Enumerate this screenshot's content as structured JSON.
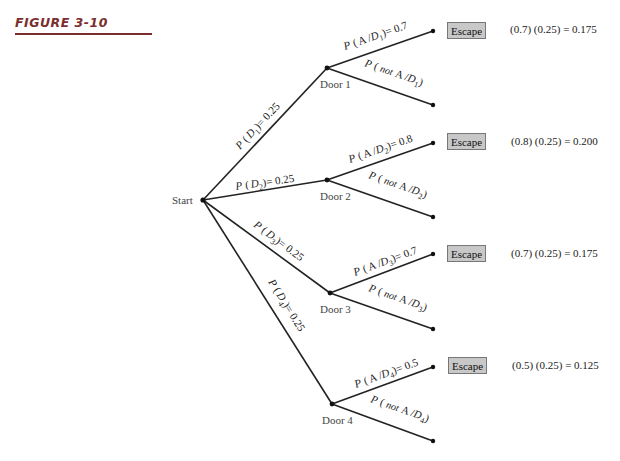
{
  "figure": {
    "title": "FIGURE 3-10",
    "accent_color": "#7a2e2e"
  },
  "tree": {
    "root": {
      "label": "Start"
    },
    "doors": [
      {
        "label": "Door 1",
        "edge_label": {
          "p": "P",
          "open": "(",
          "var": "D",
          "sub": "1",
          "close": ")= 0.25"
        },
        "escape_edge": {
          "p": "P",
          "open": "(",
          "a": "A /",
          "var": "D",
          "sub": "1",
          "close": ")= 0.7"
        },
        "fail_edge": {
          "p": "P",
          "open": "(",
          "not": "not",
          "a": "A /",
          "var": "D",
          "sub": "1",
          "close": ")"
        },
        "escape_label": "Escape",
        "formula": "(0.7) (0.25) = 0.175"
      },
      {
        "label": "Door 2",
        "edge_label": {
          "p": "P",
          "open": "(",
          "var": "D",
          "sub": "2",
          "close": ")= 0.25"
        },
        "escape_edge": {
          "p": "P",
          "open": "(",
          "a": "A /",
          "var": "D",
          "sub": "2",
          "close": ")= 0.8"
        },
        "fail_edge": {
          "p": "P",
          "open": "(",
          "not": "not",
          "a": "A /",
          "var": "D",
          "sub": "2",
          "close": ")"
        },
        "escape_label": "Escape",
        "formula": "(0.8) (0.25) = 0.200"
      },
      {
        "label": "Door 3",
        "edge_label": {
          "p": "P",
          "open": "(",
          "var": "D",
          "sub": "3",
          "close": ")= 0.25"
        },
        "escape_edge": {
          "p": "P",
          "open": "(",
          "a": "A /",
          "var": "D",
          "sub": "3",
          "close": ")= 0.7"
        },
        "fail_edge": {
          "p": "P",
          "open": "(",
          "not": "not",
          "a": "A /",
          "var": "D",
          "sub": "3",
          "close": ")"
        },
        "escape_label": "Escape",
        "formula": "(0.7) (0.25) = 0.175"
      },
      {
        "label": "Door 4",
        "edge_label": {
          "p": "P",
          "open": "(",
          "var": "D",
          "sub": "4",
          "close": ")= 0.25"
        },
        "escape_edge": {
          "p": "P",
          "open": "(",
          "a": "A /",
          "var": "D",
          "sub": "4",
          "close": ")= 0.5"
        },
        "fail_edge": {
          "p": "P",
          "open": "(",
          "not": "not",
          "a": "A /",
          "var": "D",
          "sub": "4",
          "close": ")"
        },
        "escape_label": "Escape",
        "formula": "(0.5) (0.25) = 0.125"
      }
    ]
  }
}
